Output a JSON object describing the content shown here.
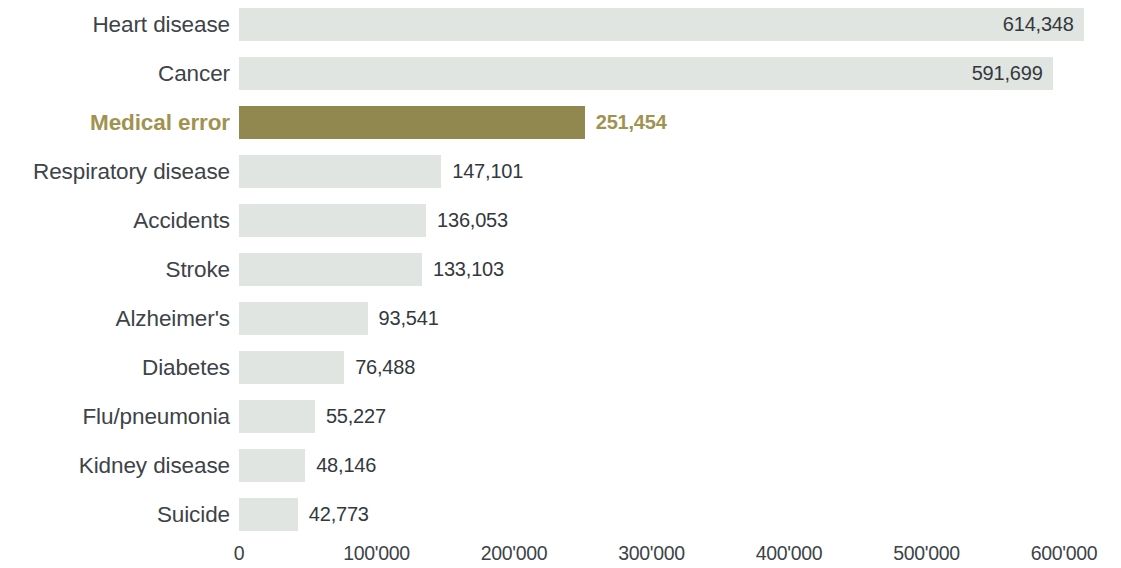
{
  "chart_data": {
    "type": "bar",
    "orientation": "horizontal",
    "title": "",
    "subtitle": "",
    "xlabel": "",
    "ylabel": "",
    "xlim": [
      0,
      620000
    ],
    "grid": false,
    "legend": null,
    "categories": [
      "Heart disease",
      "Cancer",
      "Medical error",
      "Respiratory disease",
      "Accidents",
      "Stroke",
      "Alzheimer's",
      "Diabetes",
      "Flu/pneumonia",
      "Kidney disease",
      "Suicide"
    ],
    "values": [
      614348,
      591699,
      251454,
      147101,
      136053,
      133103,
      93541,
      76488,
      55227,
      48146,
      42773
    ],
    "value_labels": [
      "614,348",
      "591,699",
      "251,454",
      "147,101",
      "136,053",
      "133,103",
      "93,541",
      "76,488",
      "55,227",
      "48,146",
      "42,773"
    ],
    "label_placement": [
      "inside",
      "inside",
      "outside",
      "outside",
      "outside",
      "outside",
      "outside",
      "outside",
      "outside",
      "outside",
      "outside"
    ],
    "highlight_index": 2,
    "xticks": [
      0,
      100000,
      200000,
      300000,
      400000,
      500000,
      600000
    ],
    "xtick_labels": [
      "0",
      "100'000",
      "200'000",
      "300'000",
      "400'000",
      "500'000",
      "600'000"
    ],
    "colors": {
      "bar_default": "#e1e5e1",
      "bar_highlight": "#918850",
      "label_default": "#3d4348",
      "label_highlight": "#a0934f",
      "value_default": "#33383d",
      "background": "#ffffff"
    }
  }
}
